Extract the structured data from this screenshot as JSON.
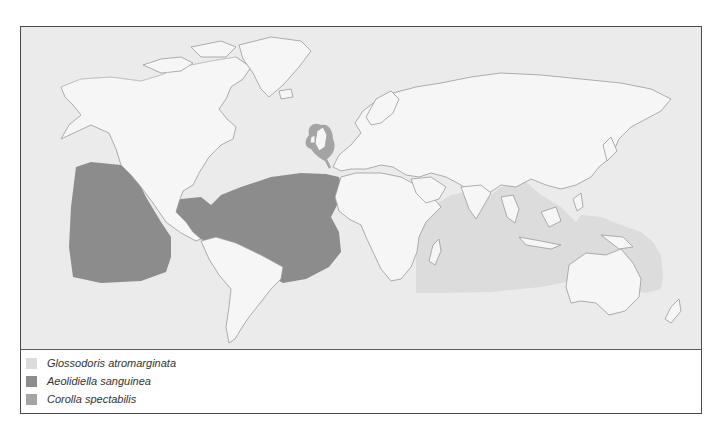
{
  "caption": "… range maps of three nudibranch species …",
  "map": {
    "colors": {
      "ocean": "#ebebeb",
      "land": "#f6f6f6",
      "coastline": "#9a9a9a",
      "frame": "#4a4a4a"
    }
  },
  "legend": {
    "items": [
      {
        "label": "Glossodoris atromarginata",
        "color": "#dcdcdc",
        "region": "Indo-Pacific (Indian Ocean to Western Pacific)"
      },
      {
        "label": "Aeolidiella sanguinea",
        "color": "#8c8c8c",
        "region": "Eastern Pacific, Caribbean, Tropical Atlantic"
      },
      {
        "label": "Corolla spectabilis",
        "color": "#a4a4a4",
        "region": "British Isles"
      }
    ]
  }
}
